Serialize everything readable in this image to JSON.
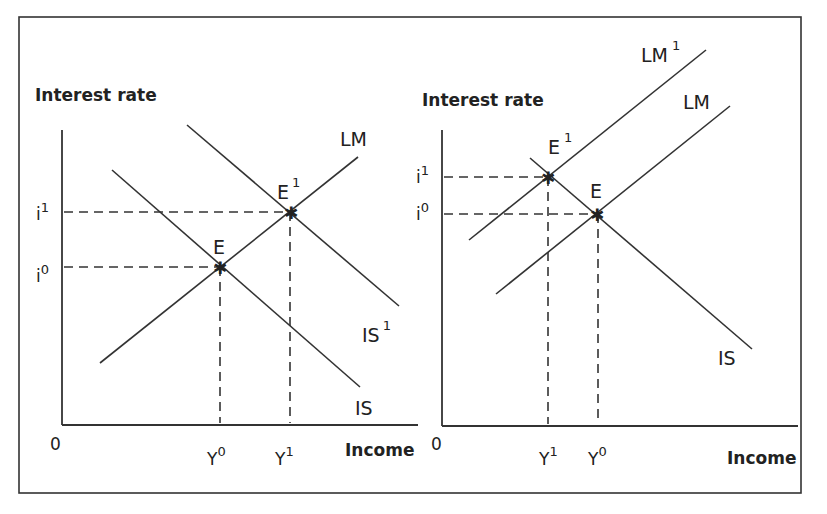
{
  "figure": {
    "panels": [
      {
        "id": "left",
        "y_axis_title": "Interest rate",
        "x_axis_title": "Income",
        "origin_label": "0",
        "y_ticks": [
          {
            "base": "i",
            "sup": "1"
          },
          {
            "base": "i",
            "sup": "0"
          }
        ],
        "x_ticks": [
          {
            "base": "Y",
            "sup": "0"
          },
          {
            "base": "Y",
            "sup": "1"
          }
        ],
        "curves": [
          {
            "name": "LM",
            "base": "LM",
            "sup": ""
          },
          {
            "name": "IS",
            "base": "IS",
            "sup": ""
          },
          {
            "name": "IS1",
            "base": "IS",
            "sup": "1"
          }
        ],
        "points": [
          {
            "base": "E",
            "sup": ""
          },
          {
            "base": "E",
            "sup": "1"
          }
        ]
      },
      {
        "id": "right",
        "y_axis_title": "Interest rate",
        "x_axis_title": "Income",
        "origin_label": "0",
        "y_ticks": [
          {
            "base": "i",
            "sup": "1"
          },
          {
            "base": "i",
            "sup": "0"
          }
        ],
        "x_ticks": [
          {
            "base": "Y",
            "sup": "1"
          },
          {
            "base": "Y",
            "sup": "0"
          }
        ],
        "curves": [
          {
            "name": "LM1",
            "base": "LM",
            "sup": "1"
          },
          {
            "name": "LM",
            "base": "LM",
            "sup": ""
          },
          {
            "name": "IS",
            "base": "IS",
            "sup": ""
          }
        ],
        "points": [
          {
            "base": "E",
            "sup": "1"
          },
          {
            "base": "E",
            "sup": ""
          }
        ]
      }
    ]
  }
}
